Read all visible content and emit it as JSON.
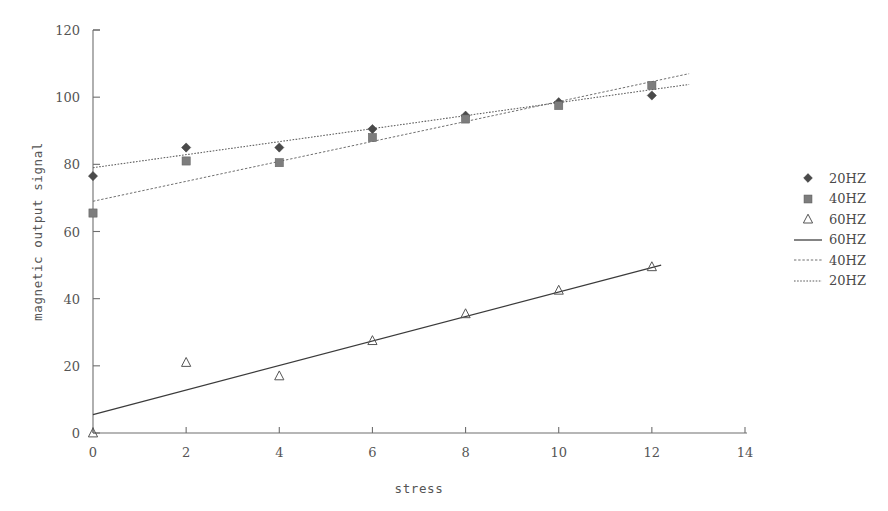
{
  "chart_data": {
    "type": "scatter",
    "title": "",
    "xlabel": "stress",
    "ylabel": "magnetic output signal",
    "xlim": [
      0,
      14
    ],
    "ylim": [
      0,
      120
    ],
    "xticks": [
      "0",
      "2",
      "4",
      "6",
      "8",
      "10",
      "12",
      "14"
    ],
    "yticks": [
      "0",
      "20",
      "40",
      "60",
      "80",
      "100",
      "120"
    ],
    "grid": false,
    "legend_position": "right",
    "x": [
      0,
      2,
      4,
      6,
      8,
      10,
      12
    ],
    "series": [
      {
        "name": "20HZ",
        "marker": "diamond",
        "color": "#4a4a4a",
        "values": [
          76.5,
          85.0,
          85.0,
          90.5,
          94.5,
          98.5,
          100.5
        ]
      },
      {
        "name": "40HZ",
        "marker": "square",
        "color": "#7d7d7d",
        "values": [
          65.5,
          81.0,
          80.5,
          88.0,
          93.5,
          97.5,
          103.5
        ]
      },
      {
        "name": "60HZ",
        "marker": "triangle",
        "color": "#555555",
        "values": [
          0.0,
          21.0,
          17.0,
          27.5,
          35.5,
          42.5,
          49.5
        ]
      }
    ],
    "trendlines": [
      {
        "name": "20HZ",
        "style": "dotted",
        "color": "#5b5b5b",
        "x0": 0,
        "y0": 79.0,
        "x1": 12.8,
        "y1": 103.8
      },
      {
        "name": "40HZ",
        "style": "dashed",
        "color": "#6f6f6f",
        "x0": 0,
        "y0": 69.0,
        "x1": 12.8,
        "y1": 107.0
      },
      {
        "name": "60HZ",
        "style": "solid",
        "color": "#3b3b3b",
        "x0": 0,
        "y0": 5.5,
        "x1": 12.2,
        "y1": 50.0
      }
    ],
    "legend": [
      {
        "label": "20HZ",
        "key": "diamond-marker"
      },
      {
        "label": "40HZ",
        "key": "square-marker"
      },
      {
        "label": "60HZ",
        "key": "triangle-marker"
      },
      {
        "label": "60HZ",
        "key": "solid-line"
      },
      {
        "label": "40HZ",
        "key": "dashed-line"
      },
      {
        "label": "20HZ",
        "key": "dotted-line"
      }
    ]
  }
}
